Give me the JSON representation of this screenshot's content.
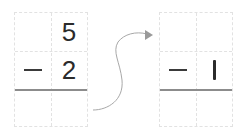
{
  "left_problem": {
    "top_digit": "5",
    "operator": "−",
    "subtrahend": "2",
    "result": ""
  },
  "right_problem": {
    "top_digit": "",
    "operator": "−",
    "subtrahend": "1",
    "result": ""
  },
  "colors": {
    "grid_line": "#e2e2e2",
    "rule_line": "#8c8c8c",
    "digit": "#2b2b2b",
    "arrow": "#a0a0a0"
  }
}
